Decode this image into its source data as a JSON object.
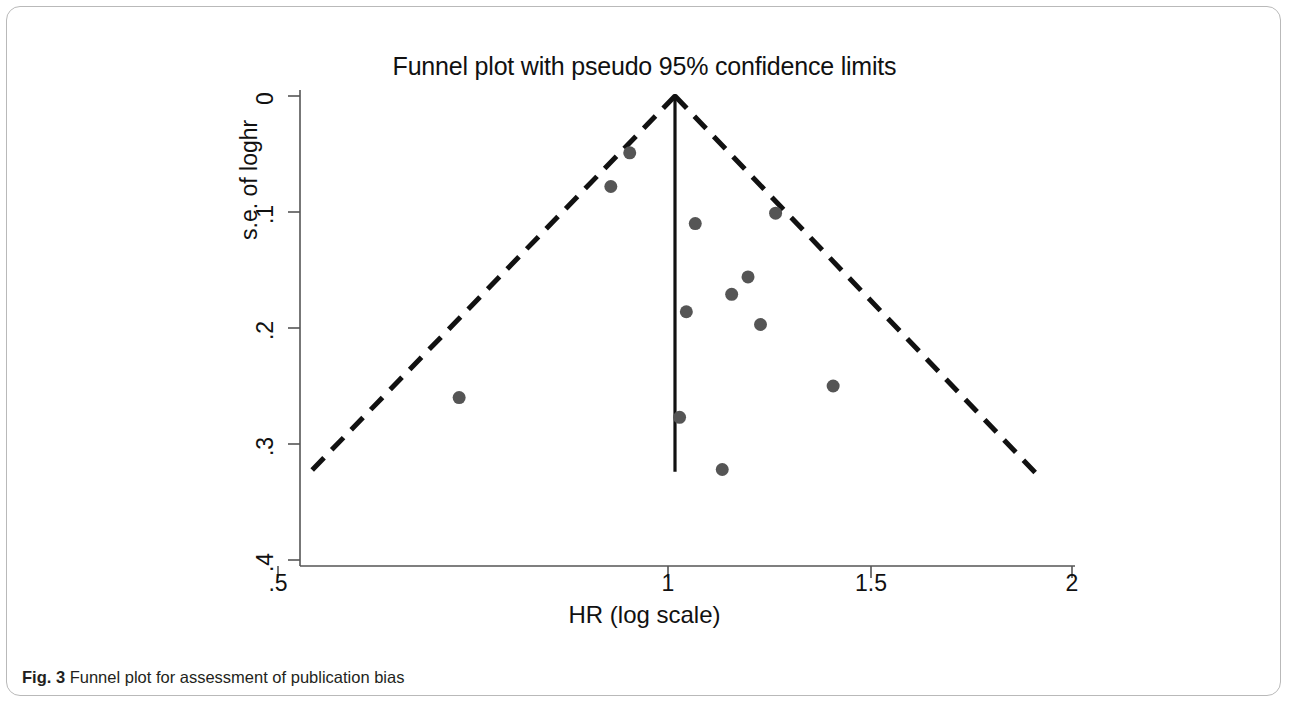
{
  "figure": {
    "caption_prefix": "Fig. 3",
    "caption_text": " Funnel plot for assessment of publication bias"
  },
  "chart_data": {
    "type": "scatter",
    "title": "Funnel plot with pseudo 95% confidence limits",
    "xlabel": "HR (log scale)",
    "ylabel": "s.e. of loghr",
    "x_scale": "log",
    "xlim": [
      0.5,
      2
    ],
    "ylim": [
      0.4,
      0
    ],
    "y_inverted": true,
    "grid": false,
    "legend": null,
    "xticks": [
      0.5,
      1,
      1.5,
      2
    ],
    "xticklabels": [
      ".5",
      "1",
      "1.5",
      "2"
    ],
    "yticks": [
      0,
      0.1,
      0.2,
      0.3,
      0.4
    ],
    "yticklabels": [
      "0",
      ".1",
      ".2",
      ".3",
      ".4"
    ],
    "marker_color": "#555555",
    "marker_size_px": 13,
    "points": [
      {
        "hr": 0.924,
        "se": 0.049
      },
      {
        "hr": 0.894,
        "se": 0.078
      },
      {
        "hr": 1.036,
        "se": 0.11
      },
      {
        "hr": 1.192,
        "se": 0.101
      },
      {
        "hr": 1.136,
        "se": 0.156
      },
      {
        "hr": 1.104,
        "se": 0.171
      },
      {
        "hr": 1.161,
        "se": 0.197
      },
      {
        "hr": 1.02,
        "se": 0.186
      },
      {
        "hr": 0.686,
        "se": 0.26
      },
      {
        "hr": 1.318,
        "se": 0.25
      },
      {
        "hr": 1.008,
        "se": 0.277
      },
      {
        "hr": 1.086,
        "se": 0.322
      }
    ],
    "reference_line": {
      "hr": 1.0,
      "se_from": 0.0,
      "se_to": 0.324,
      "style": "solid",
      "color": "#111111"
    },
    "pseudo_ci_limits": {
      "label": "pseudo 95% confidence limits",
      "style": "dashed",
      "color": "#111111",
      "apex": {
        "hr": 1.0,
        "se": 0.0
      },
      "left_end": {
        "hr": 0.528,
        "se": 0.325
      },
      "right_end": {
        "hr": 1.877,
        "se": 0.325
      }
    }
  }
}
